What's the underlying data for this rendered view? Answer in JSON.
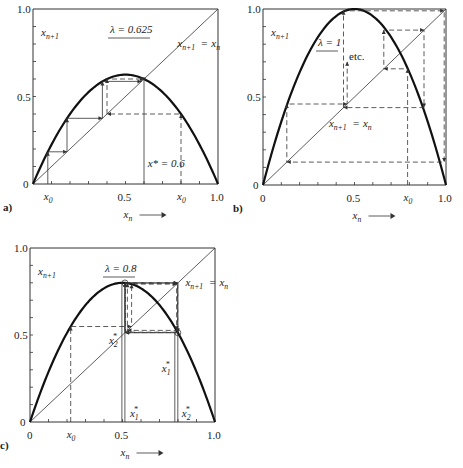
{
  "chart_data": [
    {
      "type": "line",
      "panel": "a)",
      "title": "λ = 0.625",
      "function": "x_{n+1} = 4λ x_n (1 - x_n)",
      "lambda": 0.625,
      "xlabel": "x_n",
      "ylabel": "x_{n+1}",
      "xlim": [
        0,
        1
      ],
      "ylim": [
        0,
        1
      ],
      "x_ticks": [
        "0.5",
        "1.0"
      ],
      "y_ticks": [
        "0",
        "0.5",
        "1.0"
      ],
      "diagonal_label": "x_{n+1} = x_n",
      "annotation": "x* = 0.6",
      "fixed_point": 0.6,
      "x0_labels": [
        {
          "x": 0.08,
          "text": "x0"
        },
        {
          "x": 0.8,
          "text": "x0"
        }
      ],
      "cobweb_solid_start": 0.08,
      "cobweb_solid_steps": 6,
      "cobweb_dashed_start": 0.8,
      "cobweb_dashed_steps": 4
    },
    {
      "type": "line",
      "panel": "b)",
      "title": "λ = 1",
      "function": "x_{n+1} = 4λ x_n (1 - x_n)",
      "lambda": 1.0,
      "xlabel": "x_n",
      "ylabel": "x_{n+1}",
      "xlim": [
        0,
        1
      ],
      "ylim": [
        0,
        1
      ],
      "x_ticks": [
        "0",
        "0.5",
        "1.0"
      ],
      "y_ticks": [
        "0",
        "0.5",
        "1.0"
      ],
      "diagonal_label": "x_{n+1} = x_n",
      "annotation": "etc.",
      "x0_labels": [
        {
          "x": 0.79,
          "text": "x0"
        }
      ],
      "cobweb_dashed_points": [
        [
          0.79,
          0
        ],
        [
          0.79,
          0.66
        ],
        [
          0.66,
          0.66
        ],
        [
          0.66,
          0.88
        ],
        [
          0.88,
          0.88
        ],
        [
          0.88,
          0.44
        ],
        [
          0.44,
          0.44
        ],
        [
          0.44,
          0.99
        ],
        [
          0.99,
          0.99
        ],
        [
          0.99,
          0.13
        ],
        [
          0.13,
          0.13
        ],
        [
          0.13,
          0.46
        ],
        [
          0.46,
          0.46
        ],
        [
          0.46,
          0.7
        ]
      ]
    },
    {
      "type": "line",
      "panel": "c)",
      "title": "λ = 0.8",
      "function": "x_{n+1} = 4λ x_n (1 - x_n)",
      "lambda": 0.8,
      "xlabel": "x_n",
      "ylabel": "x_{n+1}",
      "xlim": [
        0,
        1
      ],
      "ylim": [
        0,
        1
      ],
      "x_ticks": [
        "0",
        "0.5",
        "1.0"
      ],
      "y_ticks": [
        "0",
        "0.5",
        "1.0"
      ],
      "diagonal_label": "x_{n+1} = x_n",
      "x0_labels": [
        {
          "x": 0.22,
          "text": "x0"
        }
      ],
      "two_cycle": [
        0.513,
        0.799
      ],
      "cycle_labels": [
        "x1*",
        "x2*",
        "x2*",
        "x1*"
      ],
      "cobweb_dashed_start": 0.22,
      "cobweb_dashed_steps": 8
    }
  ],
  "labels": {
    "a": {
      "panel": "a)",
      "title": "λ = 0.625",
      "ylabel": "x",
      "ylabel_sub": "n+1",
      "xlabel": "x",
      "xlabel_sub": "n",
      "diag": "x",
      "diag_sub1": "n+1",
      "diag_eq": " = x",
      "diag_sub2": "n",
      "fixed": "x* = 0.6",
      "x0": "x",
      "x0_sub": "0",
      "t0": "0",
      "t05": "0.5",
      "t1": "1.0"
    },
    "b": {
      "panel": "b)",
      "title": "λ = 1",
      "etc": "etc.",
      "t0": "0",
      "t05": "0.5",
      "t1": "1.0"
    },
    "c": {
      "panel": "c)",
      "title": "λ = 0.8",
      "t0": "0",
      "t05": "0.5",
      "t1": "1.0",
      "star": "*",
      "s1": "1",
      "s2": "2"
    },
    "arrow": "⟶"
  }
}
